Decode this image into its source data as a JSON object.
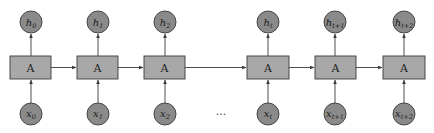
{
  "diagram": {
    "colors": {
      "node_fill": "#8a8a8a",
      "cell_fill": "#a8a8a8",
      "stroke": "#3a3a3a",
      "background": "#ffffff"
    },
    "ellipsis": "...",
    "steps": [
      {
        "cell": "A",
        "input": {
          "base": "x",
          "sub": "0"
        },
        "output": {
          "base": "h",
          "sub": "0"
        }
      },
      {
        "cell": "A",
        "input": {
          "base": "x",
          "sub": "1"
        },
        "output": {
          "base": "h",
          "sub": "1"
        }
      },
      {
        "cell": "A",
        "input": {
          "base": "x",
          "sub": "2"
        },
        "output": {
          "base": "h",
          "sub": "2"
        }
      },
      {
        "cell": "A",
        "input": {
          "base": "x",
          "sub": "t"
        },
        "output": {
          "base": "h",
          "sub": "t"
        }
      },
      {
        "cell": "A",
        "input": {
          "base": "x",
          "sub": "t+1"
        },
        "output": {
          "base": "h",
          "sub": "t+1"
        }
      },
      {
        "cell": "A",
        "input": {
          "base": "x",
          "sub": "t+2"
        },
        "output": {
          "base": "h",
          "sub": "t+2"
        }
      }
    ]
  }
}
